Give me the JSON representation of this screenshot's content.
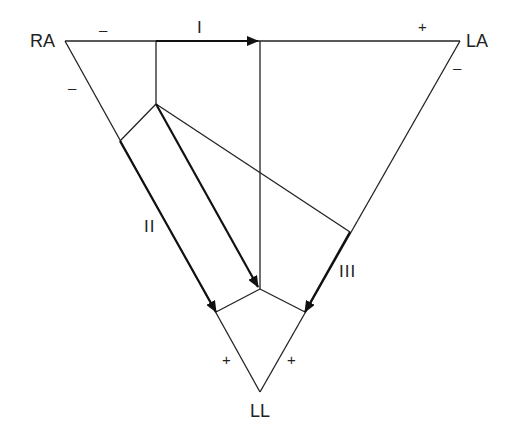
{
  "diagram": {
    "vertices": {
      "ra": "RA",
      "la": "LA",
      "ll": "LL"
    },
    "leads": {
      "lead1": "I",
      "lead2": "II",
      "lead3": "III"
    },
    "polarity": {
      "lead1_neg": "–",
      "lead1_pos": "+",
      "lead2_neg": "–",
      "lead2_pos": "+",
      "lead3_neg": "–",
      "lead3_pos": "+"
    },
    "colors": {
      "line": "#222222",
      "background": "#ffffff"
    }
  }
}
